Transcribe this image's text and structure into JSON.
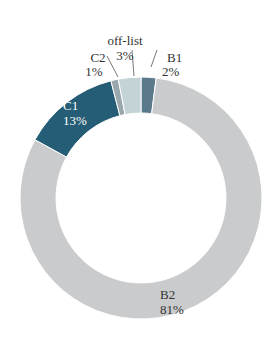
{
  "chart_data": {
    "type": "pie",
    "variant": "donut",
    "title": "",
    "start_angle_deg": 0,
    "direction": "clockwise",
    "slices": [
      {
        "label": "B1",
        "value": 2,
        "display": "2%",
        "color": "#5a7a8c"
      },
      {
        "label": "B2",
        "value": 81,
        "display": "81%",
        "color": "#c9cbcc"
      },
      {
        "label": "C1",
        "value": 13,
        "display": "13%",
        "color": "#245d75"
      },
      {
        "label": "C2",
        "value": 1,
        "display": "1%",
        "color": "#9aa7ad"
      },
      {
        "label": "off-list",
        "value": 3,
        "display": "3%",
        "color": "#c4d3d6"
      }
    ],
    "labels": {
      "B1": {
        "name": "B1",
        "pct": "2%"
      },
      "B2": {
        "name": "B2",
        "pct": "81%"
      },
      "C1": {
        "name": "C1",
        "pct": "13%"
      },
      "C2": {
        "name": "C2",
        "pct": "1%"
      },
      "off_list": {
        "name": "off-list",
        "pct": "3%"
      }
    },
    "legend": "none (direct labels)"
  }
}
